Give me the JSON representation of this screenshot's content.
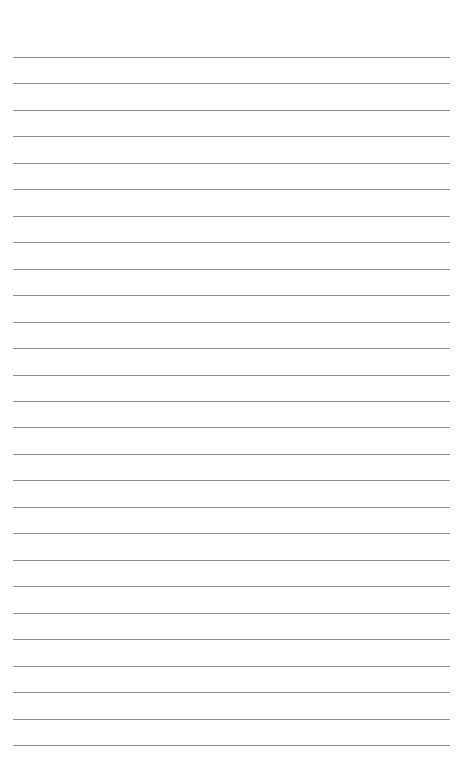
{
  "page": {
    "type": "lined-paper",
    "line_count": 27,
    "first_line_y": 57,
    "line_spacing": 26.46,
    "line_color": "#8f8f8f",
    "background": "#ffffff"
  }
}
